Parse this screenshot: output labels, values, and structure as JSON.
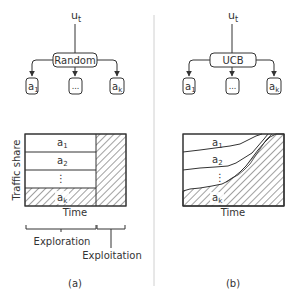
{
  "panels": [
    {
      "id": "a",
      "caption": "(a)",
      "input_label": "u",
      "input_sub": "t",
      "policy_label": "Random",
      "arms": [
        {
          "label": "a",
          "sub": "1"
        },
        {
          "label": "...",
          "sub": ""
        },
        {
          "label": "a",
          "sub": "k"
        }
      ],
      "chart": {
        "ylabel": "Traffic share",
        "xlabel": "Time",
        "bands": [
          {
            "label": "a",
            "sub": "1"
          },
          {
            "label": "a",
            "sub": "2"
          },
          {
            "label": "⋮",
            "sub": ""
          },
          {
            "label": "a",
            "sub": "k"
          }
        ]
      },
      "phases": [
        {
          "label": "Exploration"
        },
        {
          "label": "Exploitation"
        }
      ]
    },
    {
      "id": "b",
      "caption": "(b)",
      "input_label": "u",
      "input_sub": "t",
      "policy_label": "UCB",
      "arms": [
        {
          "label": "a",
          "sub": "1"
        },
        {
          "label": "...",
          "sub": ""
        },
        {
          "label": "a",
          "sub": "k"
        }
      ],
      "chart": {
        "xlabel": "Time",
        "bands": [
          {
            "label": "a",
            "sub": "1"
          },
          {
            "label": "a",
            "sub": "2"
          },
          {
            "label": "⋮",
            "sub": ""
          },
          {
            "label": "a",
            "sub": "k"
          }
        ]
      }
    }
  ],
  "colors": {
    "stroke": "#333333",
    "divider": "#cccccc",
    "background": "#ffffff"
  }
}
